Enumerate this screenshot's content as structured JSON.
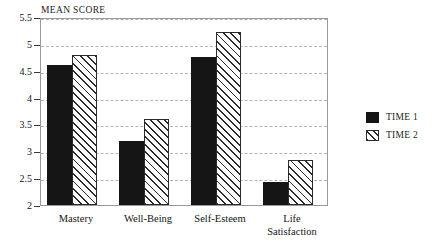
{
  "chart_data": {
    "type": "bar",
    "title": "",
    "subtitle": "",
    "xlabel": "",
    "ylabel": "MEAN SCORE",
    "ylim": [
      2,
      5.5
    ],
    "yticks": [
      2,
      2.5,
      3,
      3.5,
      4,
      4.5,
      5,
      5.5
    ],
    "ytick_labels": [
      "2",
      "2.5",
      "3",
      "3.5",
      "4",
      "4.5",
      "5",
      "5.5"
    ],
    "grid": "horizontal-dashed",
    "legend_position": "right",
    "categories": [
      "Mastery",
      "Well-Being",
      "Self-Esteem",
      "Life Satisfaction"
    ],
    "category_label_lines": [
      [
        "Mastery"
      ],
      [
        "Well-Being"
      ],
      [
        "Self-Esteem"
      ],
      [
        "Life",
        "Satisfaction"
      ]
    ],
    "series": [
      {
        "name": "TIME 1",
        "fill": "solid-black",
        "color": "#151515",
        "values": [
          4.6,
          3.2,
          4.75,
          2.43
        ]
      },
      {
        "name": "TIME 2",
        "fill": "diagonal-hatch",
        "color": "#ffffff",
        "hatch_color": "#2a2a2a",
        "values": [
          4.8,
          3.6,
          5.22,
          2.83
        ]
      }
    ]
  },
  "legend": {
    "items": [
      {
        "label": "TIME 1",
        "swatch": "solid-black-square-icon"
      },
      {
        "label": "TIME 2",
        "swatch": "hatched-square-icon"
      }
    ]
  }
}
